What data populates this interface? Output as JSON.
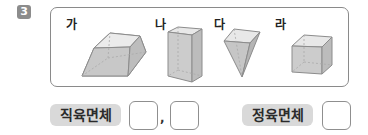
{
  "problem": {
    "number": "3"
  },
  "shapes": [
    {
      "label": "가",
      "kind": "truncated-pyramid"
    },
    {
      "label": "나",
      "kind": "rectangular-prism"
    },
    {
      "label": "다",
      "kind": "inverted-pyramid"
    },
    {
      "label": "라",
      "kind": "cube"
    }
  ],
  "answers": {
    "cuboid_label": "직육면체",
    "separator": ",",
    "cube_label": "정육면체",
    "cuboid_values": [
      "",
      ""
    ],
    "cube_value": ""
  },
  "colors": {
    "badge": "#8c8c8c",
    "label_bg": "#d9d9d9",
    "shape_fill": "#d4d4d4",
    "shape_stroke": "#8c8c8c"
  }
}
